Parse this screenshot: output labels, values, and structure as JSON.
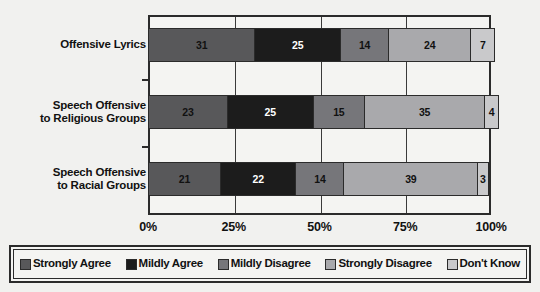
{
  "chart_data": {
    "type": "bar",
    "orientation": "horizontal",
    "stacked": true,
    "normalized_percent": true,
    "title": "",
    "subtitle": "",
    "xlabel": "",
    "ylabel": "",
    "xlim": [
      0,
      100
    ],
    "xticks": [
      0,
      25,
      50,
      75,
      100
    ],
    "xticklabels": [
      "0%",
      "25%",
      "50%",
      "75%",
      "100%"
    ],
    "grid": true,
    "grid_axis": "x",
    "legend_position": "bottom",
    "categories": [
      "Offensive Lyrics",
      "Speech Offensive to Religious Groups",
      "Speech Offensive to Racial Groups"
    ],
    "category_lines": [
      [
        "Offensive Lyrics"
      ],
      [
        "Speech Offensive",
        "to Religious Groups"
      ],
      [
        "Speech Offensive",
        "to Racial Groups"
      ]
    ],
    "series": [
      {
        "name": "Strongly Agree",
        "color": "#58585a",
        "label_color": "#111111",
        "values": [
          31,
          23,
          21
        ]
      },
      {
        "name": "Mildly Agree",
        "color": "#1c1c1c",
        "label_color": "#ffffff",
        "values": [
          25,
          25,
          22
        ]
      },
      {
        "name": "Mildly Disagree",
        "color": "#76767a",
        "label_color": "#111111",
        "values": [
          14,
          15,
          14
        ]
      },
      {
        "name": "Strongly Disagree",
        "color": "#a9a9ac",
        "label_color": "#111111",
        "values": [
          24,
          35,
          39
        ]
      },
      {
        "name": "Don't Know",
        "color": "#c9c9cb",
        "label_color": "#111111",
        "values": [
          7,
          4,
          3
        ]
      }
    ]
  },
  "legend": {
    "items": [
      {
        "label": "Strongly Agree",
        "color": "#58585a"
      },
      {
        "label": "Mildly Agree",
        "color": "#1c1c1c"
      },
      {
        "label": "Mildly Disagree",
        "color": "#76767a"
      },
      {
        "label": "Strongly Disagree",
        "color": "#a9a9ac"
      },
      {
        "label": "Don't Know",
        "color": "#c9c9cb"
      }
    ]
  },
  "colors": {
    "background": "#f1f1ef",
    "plot_background": "#f4f4f2",
    "axis": "#2b2b2b",
    "text": "#111111"
  }
}
